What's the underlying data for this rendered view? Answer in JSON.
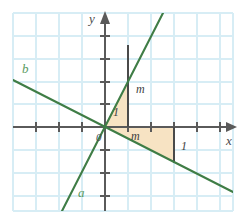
{
  "figure": {
    "type": "coordinate-plane-diagram",
    "background_color": "#ffffff",
    "grid_color": "#d7edf5",
    "axis_color": "#5a5a5a",
    "line_color": "#3f7d46",
    "shade_color": "#f7e3c3"
  },
  "axes": {
    "x_label": "x",
    "y_label": "y",
    "origin_label": "0",
    "origin_px": {
      "x": 105,
      "y": 127
    },
    "unit_px": 23,
    "x_axis": {
      "start_px": 13,
      "end_px": 228,
      "y_px": 127,
      "arrow": "right"
    },
    "y_axis": {
      "top_px": 13,
      "bottom_px": 211,
      "x_px": 105,
      "arrow": "up"
    },
    "x_ticks_px": [
      13,
      36,
      59,
      82,
      128,
      151,
      174,
      197,
      220
    ],
    "y_ticks_px": [
      26,
      49,
      72,
      95,
      150,
      173,
      196
    ]
  },
  "grid": {
    "left_px": 13,
    "top_px": 13,
    "right_px": 233,
    "bottom_px": 211,
    "spacing_px": 23
  },
  "lines": [
    {
      "name": "a",
      "label": "a",
      "label_px": {
        "x": 78,
        "y": 190
      },
      "description": "steep increasing line through origin",
      "p1_px": {
        "x": 62,
        "y": 211
      },
      "p2_px": {
        "x": 163,
        "y": 13
      },
      "slope_sign": "positive"
    },
    {
      "name": "b",
      "label": "b",
      "label_px": {
        "x": 23,
        "y": 66
      },
      "description": "decreasing line through origin",
      "p1_px": {
        "x": 13,
        "y": 80
      },
      "p2_px": {
        "x": 233,
        "y": 192
      },
      "slope_sign": "negative"
    }
  ],
  "slope_triangles": [
    {
      "for_line": "a",
      "vertices_px": [
        {
          "x": 105,
          "y": 127
        },
        {
          "x": 128,
          "y": 127
        },
        {
          "x": 128,
          "y": 82
        }
      ],
      "run_label": "1",
      "run_label_px": {
        "x": 112,
        "y": 108
      },
      "rise_label": "m",
      "rise_label_px": {
        "x": 135,
        "y": 88
      },
      "leg_top_px": {
        "x": 128,
        "y": 45
      }
    },
    {
      "for_line": "b",
      "vertices_px": [
        {
          "x": 105,
          "y": 127
        },
        {
          "x": 174,
          "y": 127
        },
        {
          "x": 174,
          "y": 162
        }
      ],
      "run_label": "m",
      "run_label_px": {
        "x": 131,
        "y": 133
      },
      "rise_label": "1",
      "rise_label_px": {
        "x": 180,
        "y": 143
      }
    }
  ],
  "labels": {
    "x": "x",
    "y": "y",
    "origin": "0",
    "line_a": "a",
    "line_b": "b",
    "triangle_a_run": "1",
    "triangle_a_rise": "m",
    "triangle_b_run": "m",
    "triangle_b_rise": "1"
  }
}
